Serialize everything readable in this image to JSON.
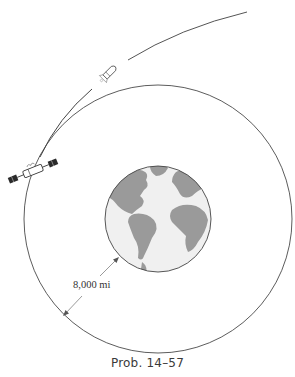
{
  "figure": {
    "caption": "Prob. 14–57",
    "dimension_label": "8,000 mi",
    "elements": {
      "earth": "earth-globe",
      "orbit": "circular-orbit",
      "trajectory": "elliptical-trajectory",
      "satellite": "satellite-icon",
      "rocket": "rocket-icon",
      "dimension": "radius-dimension-arrow"
    },
    "colors": {
      "line": "#555555",
      "earth_ocean": "#f0f0f0",
      "earth_land": "#9a9a9a",
      "text": "#333333"
    }
  }
}
